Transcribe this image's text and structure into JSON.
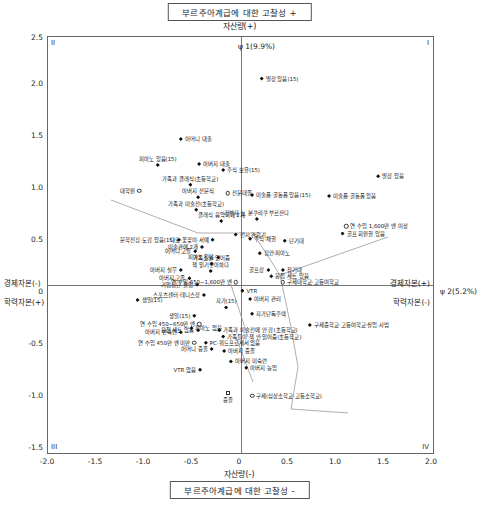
{
  "titles": {
    "top": "부르주아계급에 대한 고찰성 +",
    "bottom": "부르주아계급에 대한 고찰성 -",
    "axis_top": "자산량(+)",
    "axis_bottom": "자산량(-)"
  },
  "axis_captions": {
    "left_upper": "경제자본(-)",
    "left_lower": "학력자본(+)",
    "right_upper": "경제자본(+)",
    "right_lower": "학력자본(-)",
    "psi1": "ψ 1(9.9%)",
    "psi2": "ψ 2(5.2%)"
  },
  "quadrants": {
    "q1": "I",
    "q2": "II",
    "q3": "III",
    "q4": "IV"
  },
  "chart_data": {
    "type": "scatter",
    "title": "부르주아계급에 대한 고찰성 +",
    "xlabel": "자산량(+) / 자산량(-)",
    "ylabel": "경제자본 / 학력자본",
    "xlim": [
      -2.0,
      2.0
    ],
    "ylim": [
      -1.5,
      2.5
    ],
    "xticks": [
      "-2.0",
      "-1.5",
      "-1.0",
      "-0.5",
      "0",
      "0.5",
      "1.0",
      "1.5",
      "2.0"
    ],
    "yticks": [
      "2.5",
      "2.0",
      "1.5",
      "1.0",
      "0.5",
      "0",
      "-0.5",
      "-1.0",
      "-1.5"
    ],
    "grid": false,
    "legend": "none",
    "points": [
      {
        "label": "별장 있음(15)",
        "x": 0.22,
        "y": 2.1,
        "marker": "solid",
        "anchor": "left"
      },
      {
        "label": "어머니 대출",
        "x": -0.62,
        "y": 1.52,
        "marker": "solid",
        "anchor": "left"
      },
      {
        "label": "피아노 있음(15)",
        "x": -0.86,
        "y": 1.27,
        "marker": "solid",
        "anchor": "center-top"
      },
      {
        "label": "아버지 대출",
        "x": -0.43,
        "y": 1.28,
        "marker": "solid",
        "anchor": "left"
      },
      {
        "label": "주식 보유(15)",
        "x": -0.18,
        "y": 1.22,
        "marker": "solid",
        "anchor": "left"
      },
      {
        "label": "별장 있음",
        "x": 1.43,
        "y": 1.16,
        "marker": "solid",
        "anchor": "left"
      },
      {
        "label": "가족과 클래식(초등학교)",
        "x": -0.52,
        "y": 1.08,
        "marker": "solid",
        "anchor": "center-top"
      },
      {
        "label": "대학원",
        "x": -1.05,
        "y": 1.02,
        "marker": "open",
        "anchor": "right"
      },
      {
        "label": "아버지 전문직",
        "x": -0.44,
        "y": 0.96,
        "marker": "solid",
        "anchor": "center-top"
      },
      {
        "label": "전문대졸",
        "x": -0.13,
        "y": 1.0,
        "marker": "open",
        "anchor": "left"
      },
      {
        "label": "미술품·골동품 있음(15)",
        "x": 0.12,
        "y": 0.98,
        "marker": "solid",
        "anchor": "left"
      },
      {
        "label": "미술품·골동품 있음",
        "x": 0.92,
        "y": 0.97,
        "marker": "solid",
        "anchor": "left"
      },
      {
        "label": "가족과 미술전(초등학교)",
        "x": -0.46,
        "y": 0.84,
        "marker": "solid",
        "anchor": "center-top"
      },
      {
        "label": "클래식 음악회에 2개",
        "x": -0.2,
        "y": 0.73,
        "marker": "solid",
        "anchor": "center-top"
      },
      {
        "label": "기부자·노 분쿠라쿠 부르잔다",
        "x": 0.17,
        "y": 0.75,
        "marker": "solid",
        "anchor": "center-top"
      },
      {
        "label": "연 수입 1,600만 엔 이상",
        "x": 1.1,
        "y": 0.68,
        "marker": "open",
        "anchor": "left"
      },
      {
        "label": "골프 회원권 있음",
        "x": 1.06,
        "y": 0.61,
        "marker": "solid",
        "anchor": "left"
      },
      {
        "label": "문학전집·도감 있음(15)",
        "x": -0.64,
        "y": 0.55,
        "marker": "solid",
        "anchor": "right"
      },
      {
        "label": "다도·꽃꽂이·서예",
        "x": -0.29,
        "y": 0.55,
        "marker": "solid",
        "anchor": "right"
      },
      {
        "label": "주식·채권",
        "x": 0.1,
        "y": 0.56,
        "marker": "solid",
        "anchor": "left"
      },
      {
        "label": "전시 관람기",
        "x": -0.05,
        "y": 0.6,
        "marker": "solid",
        "anchor": "left"
      },
      {
        "label": "단기대",
        "x": 0.46,
        "y": 0.54,
        "marker": "solid",
        "anchor": "left"
      },
      {
        "label": "미술관에 2개",
        "x": -0.4,
        "y": 0.48,
        "marker": "solid",
        "anchor": "right"
      },
      {
        "label": "어머니 고졸",
        "x": -0.47,
        "y": 0.44,
        "marker": "solid",
        "anchor": "right"
      },
      {
        "label": "피아노 있음",
        "x": -0.23,
        "y": 0.38,
        "marker": "solid",
        "anchor": "right"
      },
      {
        "label": "집안·피아노",
        "x": 0.2,
        "y": 0.42,
        "marker": "solid",
        "anchor": "left"
      },
      {
        "label": "가족소설 읽어줌",
        "x": -0.3,
        "y": 0.32,
        "marker": "solid",
        "anchor": "center-top"
      },
      {
        "label": "아버지 실무",
        "x": -0.62,
        "y": 0.26,
        "marker": "solid",
        "anchor": "right"
      },
      {
        "label": "책 읽기좋아하다",
        "x": -0.31,
        "y": 0.25,
        "marker": "solid",
        "anchor": "center-top"
      },
      {
        "label": "골프장",
        "x": 0.29,
        "y": 0.26,
        "marker": "solid",
        "anchor": "right"
      },
      {
        "label": "참기대",
        "x": 0.44,
        "y": 0.26,
        "marker": "solid",
        "anchor": "left"
      },
      {
        "label": "아버지 고졸",
        "x": -0.53,
        "y": 0.18,
        "marker": "solid",
        "anchor": "right"
      },
      {
        "label": "기업집단 졸업",
        "x": -0.45,
        "y": 0.12,
        "marker": "solid",
        "anchor": "right"
      },
      {
        "label": "연 수입 650~1,600만 엔",
        "x": -0.05,
        "y": 0.14,
        "marker": "open",
        "anchor": "right"
      },
      {
        "label": "응접 세트 있음",
        "x": 0.32,
        "y": 0.2,
        "marker": "solid",
        "anchor": "left"
      },
      {
        "label": "구제대학교·고등여학교",
        "x": 0.44,
        "y": 0.14,
        "marker": "open",
        "anchor": "left"
      },
      {
        "label": "VTR",
        "x": 0.02,
        "y": 0.06,
        "marker": "solid",
        "anchor": "left"
      },
      {
        "label": "스포츠센터·테니스장",
        "x": -0.38,
        "y": 0.02,
        "marker": "solid",
        "anchor": "right"
      },
      {
        "label": "아버지 관리",
        "x": 0.1,
        "y": -0.02,
        "marker": "solid",
        "anchor": "left"
      },
      {
        "label": "생일(15)",
        "x": -1.07,
        "y": -0.03,
        "marker": "solid",
        "anchor": "left"
      },
      {
        "label": "생일(15)",
        "x": -0.48,
        "y": -0.18,
        "marker": "solid",
        "anchor": "right"
      },
      {
        "label": "자가(15)",
        "x": -0.15,
        "y": -0.1,
        "marker": "solid",
        "anchor": "center-top"
      },
      {
        "label": "자가단독주택",
        "x": 0.12,
        "y": -0.16,
        "marker": "solid",
        "anchor": "left"
      },
      {
        "label": "연 수입 450~650만 엔",
        "x": -0.43,
        "y": -0.26,
        "marker": "open",
        "anchor": "right"
      },
      {
        "label": "응접 세트 없음",
        "x": -0.44,
        "y": -0.32,
        "marker": "solid",
        "anchor": "right"
      },
      {
        "label": "피아노 없음",
        "x": -0.51,
        "y": -0.3,
        "marker": "solid",
        "anchor": "left"
      },
      {
        "label": "구제중학교·고등여학교·실업·사범",
        "x": 0.72,
        "y": -0.27,
        "marker": "solid",
        "anchor": "left"
      },
      {
        "label": "아버지 반숙련",
        "x": -0.62,
        "y": -0.34,
        "marker": "solid",
        "anchor": "right"
      },
      {
        "label": "가족과 미술전에 안 감(초등학교)",
        "x": -0.22,
        "y": -0.32,
        "marker": "solid",
        "anchor": "left"
      },
      {
        "label": "가족들이 책 안 읽어줌(초등학교)",
        "x": -0.18,
        "y": -0.38,
        "marker": "solid",
        "anchor": "left"
      },
      {
        "label": "연 수입 450만 엔 미만",
        "x": -0.48,
        "y": -0.44,
        "marker": "open",
        "anchor": "right"
      },
      {
        "label": "PC·워드프로세서 없음",
        "x": -0.36,
        "y": -0.44,
        "marker": "solid",
        "anchor": "left"
      },
      {
        "label": "어머니 중졸",
        "x": -0.3,
        "y": -0.5,
        "marker": "solid",
        "anchor": "right"
      },
      {
        "label": "아버지 중졸",
        "x": -0.17,
        "y": -0.52,
        "marker": "solid",
        "anchor": "left"
      },
      {
        "label": "VTR 없음",
        "x": -0.42,
        "y": -0.7,
        "marker": "solid",
        "anchor": "right"
      },
      {
        "label": "아버지 미숙련",
        "x": -0.1,
        "y": -0.62,
        "marker": "solid",
        "anchor": "left"
      },
      {
        "label": "아버지 농업",
        "x": 0.06,
        "y": -0.68,
        "marker": "solid",
        "anchor": "left"
      },
      {
        "label": "중졸",
        "x": -0.13,
        "y": -0.92,
        "marker": "sq",
        "anchor": "center-bottom"
      },
      {
        "label": "구제(심상소학교·고등소학교)",
        "x": 0.12,
        "y": -0.95,
        "marker": "open",
        "anchor": "left"
      }
    ]
  }
}
